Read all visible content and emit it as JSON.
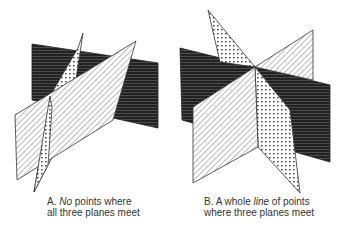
{
  "figure": {
    "panels": [
      {
        "id": "A",
        "caption_prefix": "A. ",
        "caption_emphasis": "No",
        "caption_rest_line1": " points where",
        "caption_line2": "all three planes meet",
        "planes": [
          {
            "name": "dark plane",
            "fill": "horizontal-stripes-dark"
          },
          {
            "name": "dotted plane",
            "fill": "dots"
          },
          {
            "name": "hatched plane",
            "fill": "diagonal-hatch"
          }
        ]
      },
      {
        "id": "B",
        "caption_prefix": "B. A whole ",
        "caption_emphasis": "line",
        "caption_rest_line1": " of points",
        "caption_line2": "where three planes meet",
        "planes": [
          {
            "name": "dark plane",
            "fill": "horizontal-stripes-dark"
          },
          {
            "name": "dotted plane",
            "fill": "dots"
          },
          {
            "name": "hatched plane",
            "fill": "diagonal-hatch"
          }
        ]
      }
    ],
    "colors": {
      "ink": "#333333",
      "dark_fill": "#2a2a2a",
      "paper": "#ffffff"
    }
  }
}
